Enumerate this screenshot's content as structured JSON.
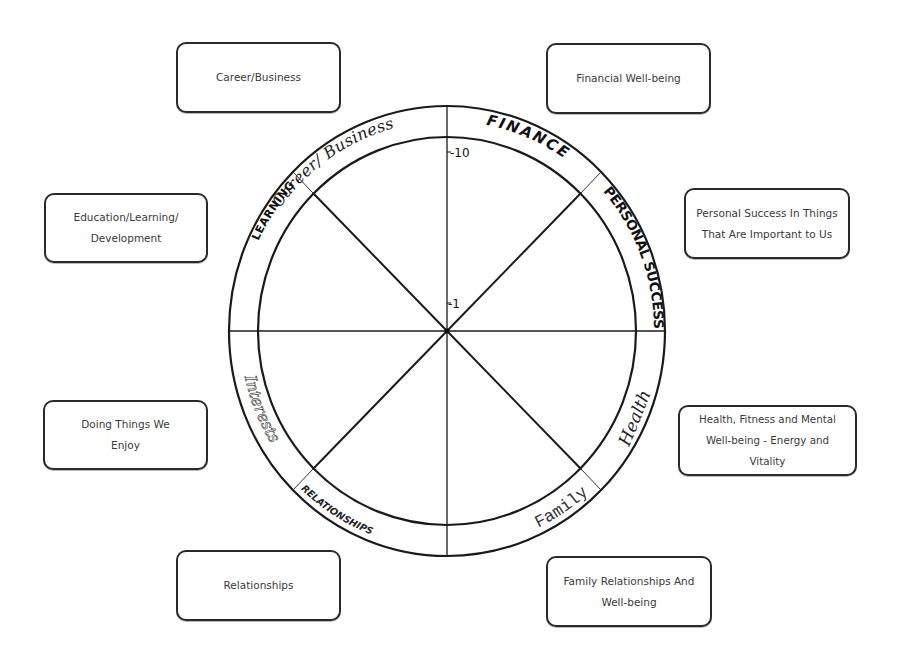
{
  "diagram": {
    "scale": {
      "max_label": "-10",
      "min_label": "-1"
    },
    "wheel_segments": [
      {
        "key": "career",
        "label": "Career/ Business",
        "style": "script"
      },
      {
        "key": "finance",
        "label": "FINANCE",
        "style": "bold-caps"
      },
      {
        "key": "personal",
        "label": "PERSONAL SUCCESS",
        "style": "condensed-caps"
      },
      {
        "key": "health",
        "label": "Health",
        "style": "script"
      },
      {
        "key": "family",
        "label": "Family",
        "style": "typewriter"
      },
      {
        "key": "relationships",
        "label": "RELATIONSHIPS",
        "style": "small-caps"
      },
      {
        "key": "interests",
        "label": "Interests",
        "style": "script-outline"
      },
      {
        "key": "learning",
        "label": "LEARNING",
        "style": "bold-caps"
      }
    ],
    "boxes": {
      "career": {
        "lines": [
          "Career/Business"
        ]
      },
      "finance": {
        "lines": [
          "Financial Well-being"
        ]
      },
      "learning": {
        "lines": [
          "Education/Learning/",
          "Development"
        ]
      },
      "personal": {
        "lines": [
          "Personal Success In Things",
          "That Are Important to Us"
        ]
      },
      "interests": {
        "lines": [
          "Doing Things We",
          "Enjoy"
        ]
      },
      "health": {
        "lines": [
          "Health, Fitness and Mental",
          "Well-being - Energy and Vitality"
        ]
      },
      "relationships": {
        "lines": [
          "Relationships"
        ]
      },
      "family": {
        "lines": [
          "Family Relationships And",
          "Well-being"
        ]
      }
    },
    "colors": {
      "line": "#1a1a1a",
      "text": "#3a3a3a",
      "background": "#ffffff"
    }
  }
}
